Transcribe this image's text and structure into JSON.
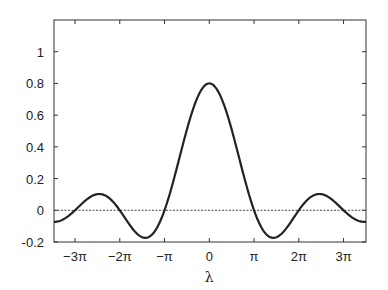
{
  "chart_data": {
    "type": "line",
    "title": "",
    "xlabel": "λ",
    "ylabel": "",
    "xlim": [
      -10.9,
      11.0
    ],
    "ylim": [
      -0.2,
      1.2
    ],
    "grid": false,
    "legend": null,
    "x_ticks": [
      {
        "value": -9.4248,
        "label": "−3π"
      },
      {
        "value": -6.2832,
        "label": "−2π"
      },
      {
        "value": -3.1416,
        "label": "−π"
      },
      {
        "value": 0,
        "label": "0"
      },
      {
        "value": 3.1416,
        "label": "π"
      },
      {
        "value": 6.2832,
        "label": "2π"
      },
      {
        "value": 9.4248,
        "label": "3π"
      }
    ],
    "y_ticks": [
      {
        "value": -0.2,
        "label": "-0.2"
      },
      {
        "value": 0,
        "label": "0"
      },
      {
        "value": 0.2,
        "label": "0.2"
      },
      {
        "value": 0.4,
        "label": "0.4"
      },
      {
        "value": 0.6,
        "label": "0.6"
      },
      {
        "value": 0.8,
        "label": "0.8"
      },
      {
        "value": 1.0,
        "label": "1"
      }
    ],
    "series": [
      {
        "name": "curve",
        "style": "solid",
        "color": "#222222",
        "description": "0.8·sin(λ)/λ",
        "points": [
          {
            "x": -10.9,
            "y": -0.073
          },
          {
            "x": -9.4248,
            "y": 0.0
          },
          {
            "x": -7.725,
            "y": 0.103
          },
          {
            "x": -6.2832,
            "y": 0.0
          },
          {
            "x": -4.493,
            "y": -0.174
          },
          {
            "x": -3.1416,
            "y": 0.0
          },
          {
            "x": 0,
            "y": 0.8
          },
          {
            "x": 3.1416,
            "y": 0.0
          },
          {
            "x": 4.493,
            "y": -0.174
          },
          {
            "x": 6.2832,
            "y": 0.0
          },
          {
            "x": 7.725,
            "y": 0.103
          },
          {
            "x": 9.4248,
            "y": 0.0
          },
          {
            "x": 11.0,
            "y": -0.073
          }
        ]
      },
      {
        "name": "zero-line",
        "style": "dotted",
        "color": "#444444",
        "points": [
          {
            "x": -10.9,
            "y": 0
          },
          {
            "x": 11.0,
            "y": 0
          }
        ]
      }
    ],
    "annotations": []
  },
  "layout": {
    "plot": {
      "left": 54,
      "top": 20,
      "right": 366,
      "bottom": 242
    }
  }
}
